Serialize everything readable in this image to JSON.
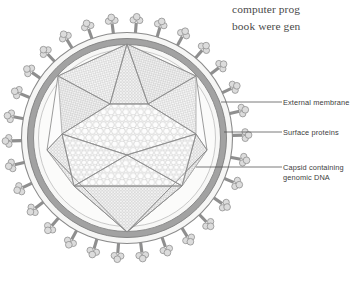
{
  "figure": {
    "name": "virus-structure-diagram",
    "colors": {
      "membrane_band": "#9b9b9b",
      "membrane_inner": "#f4f4f2",
      "capsid_line": "#8d8d8d",
      "capsid_fill": "#fbfbfa",
      "spike_stalk": "#8f8f8f",
      "spike_head": "#dcdcdc",
      "leader_line": "#5a5a5a",
      "label_text": "#3c3c3c",
      "body_text": "#4a4a4a",
      "background": "#ffffff"
    },
    "geometry": {
      "center_x": 127,
      "center_y": 138,
      "membrane_outer_radius": 106,
      "membrane_inner_radius": 99,
      "lumen_radius": 92,
      "capsid_radius": 80,
      "spike_count": 30
    }
  },
  "body_text": {
    "line1": "computer prog",
    "line2": "book were gen"
  },
  "callouts": [
    {
      "id": "external-membrane",
      "label": "External membrane",
      "leader_from_x": 282,
      "leader_from_y": 102,
      "leader_to_x": 221,
      "leader_to_y": 102
    },
    {
      "id": "surface-proteins",
      "label": "Surface proteins",
      "leader_from_x": 282,
      "leader_from_y": 132,
      "leader_to_x": 224,
      "leader_to_y": 132
    },
    {
      "id": "capsid",
      "label": "Capsid containing\ngenomic DNA",
      "leader_from_x": 282,
      "leader_from_y": 167,
      "leader_to_x": 196,
      "leader_to_y": 167
    }
  ]
}
